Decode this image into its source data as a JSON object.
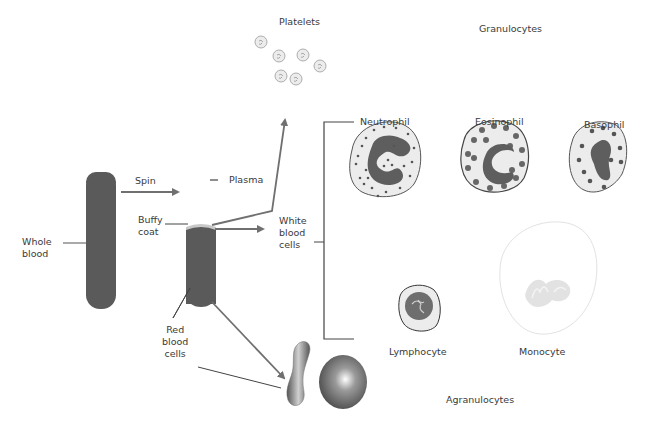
{
  "diagram": {
    "labels": {
      "whole_blood": [
        "Whole",
        "blood"
      ],
      "spin": "Spin",
      "plasma": "Plasma",
      "buffy_coat": [
        "Buffy",
        "coat"
      ],
      "white_blood_cells": [
        "White",
        "blood",
        "cells"
      ],
      "red_blood_cells": [
        "Red",
        "blood",
        "cells"
      ],
      "platelets": "Platelets",
      "granulocytes": "Granulocytes",
      "agranulocytes": "Agranulocytes",
      "neutrophil": "Neutrophil",
      "eosinophil": "Eosinophil",
      "basophil": "Basophil",
      "lymphocyte": "Lymphocyte",
      "monocyte": "Monocyte"
    },
    "colors": {
      "tube": "#5a5a5a",
      "arrow": "#707070",
      "buffy": "#c8c8c8",
      "cell_fill": "#ececec",
      "nucleus": "#5e5e5e",
      "granule": "#555555"
    }
  }
}
